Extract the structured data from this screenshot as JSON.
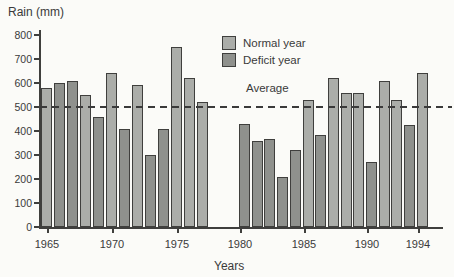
{
  "labels": {
    "y_axis_title": "Rain (mm)",
    "x_axis_title": "Years",
    "average_label": "Average"
  },
  "legend": [
    {
      "label": "Normal year",
      "type": "normal",
      "color": "#abada9"
    },
    {
      "label": "Deficit year",
      "type": "deficit",
      "color": "#8f918d"
    }
  ],
  "colors": {
    "normal_bar": "#abada9",
    "deficit_bar": "#8f918d",
    "outline": "#3f3f3d",
    "background": "#fbfbf8"
  },
  "chart_data": {
    "type": "bar",
    "title": "",
    "ylabel": "Rain (mm)",
    "xlabel": "Years",
    "ylim": [
      0,
      800
    ],
    "yticks": [
      0,
      100,
      200,
      300,
      400,
      500,
      600,
      700,
      800
    ],
    "xticks": [
      1965,
      1970,
      1975,
      1980,
      1985,
      1990,
      1994
    ],
    "average_line": 500,
    "grid": false,
    "legend_position": "top-center",
    "missing_years": [
      1978,
      1979
    ],
    "bars": [
      {
        "year": 1965,
        "value": 580,
        "type": "normal"
      },
      {
        "year": 1966,
        "value": 600,
        "type": "deficit"
      },
      {
        "year": 1967,
        "value": 610,
        "type": "deficit"
      },
      {
        "year": 1968,
        "value": 550,
        "type": "normal"
      },
      {
        "year": 1969,
        "value": 460,
        "type": "deficit"
      },
      {
        "year": 1970,
        "value": 640,
        "type": "normal"
      },
      {
        "year": 1971,
        "value": 410,
        "type": "deficit"
      },
      {
        "year": 1972,
        "value": 590,
        "type": "normal"
      },
      {
        "year": 1973,
        "value": 300,
        "type": "deficit"
      },
      {
        "year": 1974,
        "value": 410,
        "type": "deficit"
      },
      {
        "year": 1975,
        "value": 750,
        "type": "normal"
      },
      {
        "year": 1976,
        "value": 620,
        "type": "normal"
      },
      {
        "year": 1977,
        "value": 520,
        "type": "normal"
      },
      {
        "year": 1980,
        "value": 430,
        "type": "deficit"
      },
      {
        "year": 1981,
        "value": 360,
        "type": "deficit"
      },
      {
        "year": 1982,
        "value": 365,
        "type": "deficit"
      },
      {
        "year": 1983,
        "value": 210,
        "type": "deficit"
      },
      {
        "year": 1984,
        "value": 320,
        "type": "deficit"
      },
      {
        "year": 1985,
        "value": 530,
        "type": "normal"
      },
      {
        "year": 1986,
        "value": 385,
        "type": "deficit"
      },
      {
        "year": 1987,
        "value": 620,
        "type": "normal"
      },
      {
        "year": 1988,
        "value": 560,
        "type": "normal"
      },
      {
        "year": 1989,
        "value": 560,
        "type": "normal"
      },
      {
        "year": 1990,
        "value": 270,
        "type": "deficit"
      },
      {
        "year": 1991,
        "value": 610,
        "type": "normal"
      },
      {
        "year": 1992,
        "value": 530,
        "type": "normal"
      },
      {
        "year": 1993,
        "value": 425,
        "type": "deficit"
      },
      {
        "year": 1994,
        "value": 640,
        "type": "normal"
      }
    ]
  }
}
